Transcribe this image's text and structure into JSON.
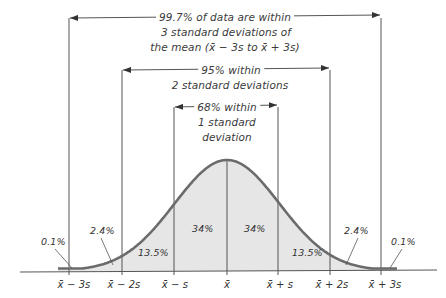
{
  "diagram": {
    "title_type": "Empirical rule for normal distribution",
    "colors": {
      "fill": "#e6e6e6",
      "curve": "#6b6b6b",
      "lines": "#555555",
      "text": "#3a3a3a",
      "background": "#ffffff"
    },
    "brackets": [
      {
        "id": "three_sd",
        "lines": [
          "99.7% of data are within",
          "3 standard deviations of",
          "the mean (x̄ − 3s to x̄ + 3s)"
        ],
        "left_x": 69,
        "right_x": 381,
        "y": 18
      },
      {
        "id": "two_sd",
        "lines": [
          "95% within",
          "2 standard deviations"
        ],
        "left_x": 122,
        "right_x": 330,
        "y": 70
      },
      {
        "id": "one_sd",
        "lines": [
          "68% within",
          "1 standard",
          "deviation"
        ],
        "left_x": 174,
        "right_x": 278,
        "y": 107
      }
    ],
    "axis_labels": [
      {
        "text": "x̄ − 3s",
        "x": 74
      },
      {
        "text": "x̄ − 2s",
        "x": 124
      },
      {
        "text": "x̄ − s",
        "x": 175
      },
      {
        "text": "x̄",
        "x": 227
      },
      {
        "text": "x̄ + s",
        "x": 280
      },
      {
        "text": "x̄ + 2s",
        "x": 332
      },
      {
        "text": "x̄ + 3s",
        "x": 385
      }
    ],
    "region_labels": [
      {
        "text": "0.1%",
        "x": 41,
        "y": 241
      },
      {
        "text": "2.4%",
        "x": 90,
        "y": 230
      },
      {
        "text": "13.5%",
        "x": 138,
        "y": 252
      },
      {
        "text": "34%",
        "x": 192,
        "y": 228
      },
      {
        "text": "34%",
        "x": 244,
        "y": 228
      },
      {
        "text": "13.5%",
        "x": 293,
        "y": 252
      },
      {
        "text": "2.4%",
        "x": 344,
        "y": 230
      },
      {
        "text": "0.1%",
        "x": 391,
        "y": 241
      }
    ],
    "percentages": {
      "within_1sd": "68%",
      "within_2sd": "95%",
      "within_3sd": "99.7%",
      "mean_to_1sd": "34%",
      "1sd_to_2sd": "13.5%",
      "2sd_to_3sd": "2.4%",
      "beyond_3sd": "0.1%"
    }
  }
}
